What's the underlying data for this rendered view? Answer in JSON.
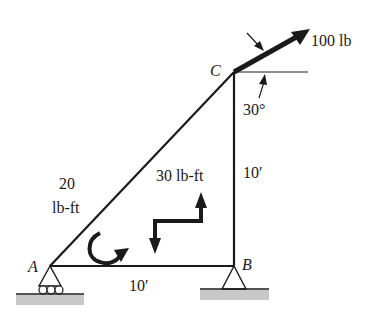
{
  "diagram": {
    "type": "truss-frame",
    "points": {
      "A": {
        "label": "A"
      },
      "B": {
        "label": "B"
      },
      "C": {
        "label": "C"
      }
    },
    "force": {
      "label": "100 lb",
      "angle_label": "30°"
    },
    "couples": [
      {
        "label_line1": "20",
        "label_line2": "lb-ft",
        "direction": "counterclockwise-curl"
      },
      {
        "label": "30 lb-ft",
        "type": "z-arrow-couple"
      }
    ],
    "dimensions": {
      "horizontal": "10′",
      "vertical": "10′"
    },
    "supports": {
      "A": "roller",
      "B": "pin"
    },
    "colors": {
      "line": "#1a1a1a",
      "ground": "#c8c8c8"
    }
  }
}
